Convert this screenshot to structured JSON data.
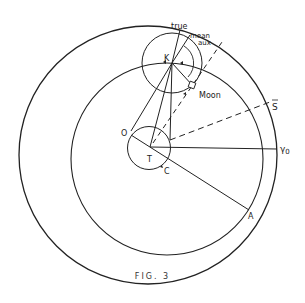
{
  "figure": {
    "caption": "FIG. 3",
    "stroke_color": "#222222",
    "background": "#ffffff"
  },
  "labels": {
    "true": "true",
    "mean": "mean",
    "aux": "aux",
    "K": "K",
    "Moon": "Moon",
    "S_bar": "S",
    "O": "O",
    "T": "T",
    "C": "C",
    "gamma0": "γ",
    "gamma0_sub": "0",
    "A": "A"
  },
  "elements": {
    "outer_circle": "Outer circle (zodiac / ecliptic)",
    "deferent": "Deferent circle",
    "epicycle": "Epicycle centered at K",
    "small_circle": "Small circle around T (earth)",
    "dashed_lines": [
      "T to aux point",
      "C to mean sun S-bar"
    ]
  }
}
